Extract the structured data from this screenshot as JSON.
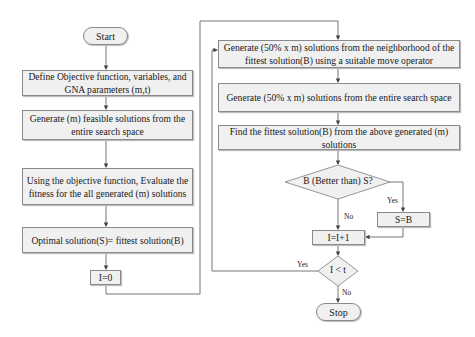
{
  "flowchart": {
    "start": "Start",
    "stop": "Stop",
    "left_column": [
      "Define Objective function, variables, and GNA parameters (m,t)",
      "Generate (m) feasible solutions from the entire search space",
      "Using the objective function, Evaluate the fitness for the all generated (m) solutions",
      "Optimal solution(S)= fittest solution(B)"
    ],
    "init": "I=0",
    "right_column": [
      "Generate (50% x m) solutions from the neighborhood of the fittest solution(B) using a suitable move operator",
      "Generate (50% x m) solutions from the entire search space",
      "Find the fittest solution(B) from the above generated (m) solutions"
    ],
    "decision1": "B (Better than) S?",
    "decision1_yes": "Yes",
    "decision1_no": "No",
    "assign": "S=B",
    "increment": "I=I+1",
    "decision2": "I < t",
    "decision2_yes": "Yes",
    "decision2_no": "No"
  }
}
